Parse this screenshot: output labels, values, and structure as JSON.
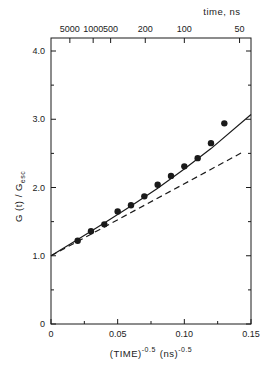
{
  "chart_data": {
    "type": "scatter",
    "title": "",
    "xlabel": "(TIME)^-0.5 (ns)^-0.5",
    "xlabel_parts": {
      "base": "(TIME)",
      "exp1": "-0.5",
      "unit": "(ns)",
      "exp2": "-0.5"
    },
    "ylabel": "G(t) / G_esc",
    "ylabel_parts": {
      "main": "G (t) / G",
      "sub": "esc"
    },
    "top_xlabel": "time, ns",
    "xlim": [
      0,
      0.15
    ],
    "ylim": [
      0,
      4.0
    ],
    "grid": false,
    "x_ticks": [
      {
        "value": 0,
        "label": "0"
      },
      {
        "value": 0.05,
        "label": "0.05"
      },
      {
        "value": 0.1,
        "label": "0.10"
      },
      {
        "value": 0.15,
        "label": "0.15"
      }
    ],
    "x_minor_ticks": [
      0.025,
      0.075,
      0.125
    ],
    "y_ticks": [
      {
        "value": 0,
        "label": "0"
      },
      {
        "value": 1.0,
        "label": "1.0"
      },
      {
        "value": 2.0,
        "label": "2.0"
      },
      {
        "value": 3.0,
        "label": "3.0"
      },
      {
        "value": 4.0,
        "label": "4.0"
      }
    ],
    "y_minor_ticks": [
      0.5,
      1.5,
      2.5,
      3.5
    ],
    "top_ticks": [
      {
        "time_ns": 5000,
        "label": "5000"
      },
      {
        "time_ns": 1000,
        "label": "1000"
      },
      {
        "time_ns": 500,
        "label": "500"
      },
      {
        "time_ns": 200,
        "label": "200"
      },
      {
        "time_ns": 100,
        "label": "100"
      },
      {
        "time_ns": 50,
        "label": "50"
      }
    ],
    "series": [
      {
        "name": "experimental",
        "style": "points",
        "marker": "filled-circle",
        "x": [
          0.02,
          0.03,
          0.04,
          0.05,
          0.06,
          0.07,
          0.08,
          0.09,
          0.1,
          0.11,
          0.12,
          0.13
        ],
        "y": [
          1.22,
          1.36,
          1.46,
          1.65,
          1.74,
          1.87,
          2.04,
          2.17,
          2.31,
          2.43,
          2.65,
          2.94
        ]
      },
      {
        "name": "fit-solid",
        "style": "solid-line",
        "x": [
          0,
          0.02,
          0.04,
          0.06,
          0.08,
          0.1,
          0.12,
          0.15
        ],
        "y": [
          1.0,
          1.24,
          1.48,
          1.73,
          1.99,
          2.27,
          2.57,
          3.07
        ]
      },
      {
        "name": "fit-dashed",
        "style": "dashed-line",
        "x": [
          0,
          0.145
        ],
        "y": [
          1.0,
          2.53
        ]
      }
    ]
  },
  "colors": {
    "ink": "#1a1a1a",
    "background": "#ffffff"
  }
}
